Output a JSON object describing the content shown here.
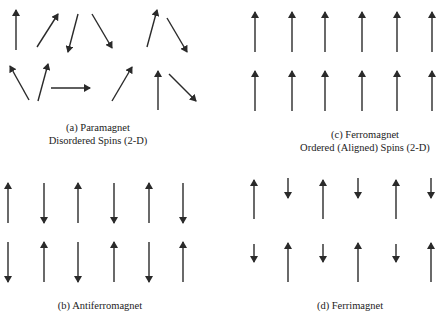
{
  "panels": [
    {
      "id": "a",
      "caption_line1": "(a) Paramagnet",
      "caption_line2": "Disordered Spins (2-D)",
      "arrows": [
        [
          16,
          50,
          16,
          10
        ],
        [
          37,
          47,
          58,
          14
        ],
        [
          78,
          14,
          68,
          52
        ],
        [
          92,
          14,
          112,
          48
        ],
        [
          147,
          47,
          157,
          10
        ],
        [
          167,
          18,
          187,
          52
        ],
        [
          29,
          100,
          10,
          66
        ],
        [
          38,
          101,
          48,
          64
        ],
        [
          51,
          88,
          90,
          88
        ],
        [
          112,
          101,
          132,
          67
        ],
        [
          158,
          110,
          158,
          71
        ],
        [
          169,
          74,
          196,
          101
        ]
      ]
    },
    {
      "id": "c",
      "caption_line1": "(c) Ferromagnet",
      "caption_line2": "Ordered (Aligned) Spins (2-D)",
      "arrows": [
        [
          255,
          52,
          255,
          12
        ],
        [
          292,
          52,
          292,
          12
        ],
        [
          325,
          52,
          325,
          12
        ],
        [
          362,
          52,
          362,
          12
        ],
        [
          397,
          52,
          397,
          12
        ],
        [
          432,
          52,
          432,
          12
        ],
        [
          255,
          111,
          255,
          71
        ],
        [
          292,
          111,
          292,
          71
        ],
        [
          325,
          111,
          325,
          71
        ],
        [
          362,
          111,
          362,
          71
        ],
        [
          397,
          111,
          397,
          71
        ],
        [
          432,
          111,
          432,
          71
        ]
      ]
    },
    {
      "id": "b",
      "caption_line1": "(b) Antiferromagnet",
      "caption_line2": "",
      "arrows": [
        [
          8,
          223,
          8,
          183
        ],
        [
          44,
          183,
          44,
          223
        ],
        [
          78,
          223,
          78,
          183
        ],
        [
          114,
          183,
          114,
          223
        ],
        [
          149,
          223,
          149,
          183
        ],
        [
          183,
          183,
          183,
          223
        ],
        [
          8,
          242,
          8,
          282
        ],
        [
          44,
          282,
          44,
          242
        ],
        [
          78,
          242,
          78,
          282
        ],
        [
          114,
          282,
          114,
          242
        ],
        [
          149,
          242,
          149,
          282
        ],
        [
          183,
          282,
          183,
          242
        ]
      ]
    },
    {
      "id": "d",
      "caption_line1": "(d) Ferrimagnet",
      "caption_line2": "",
      "arrows": [
        [
          254,
          219,
          254,
          180
        ],
        [
          288,
          178,
          288,
          198
        ],
        [
          323,
          219,
          323,
          180
        ],
        [
          358,
          178,
          358,
          198
        ],
        [
          396,
          219,
          396,
          180
        ],
        [
          431,
          178,
          431,
          198
        ],
        [
          254,
          244,
          254,
          262
        ],
        [
          288,
          282,
          288,
          243
        ],
        [
          323,
          244,
          323,
          262
        ],
        [
          358,
          282,
          358,
          243
        ],
        [
          396,
          244,
          396,
          262
        ],
        [
          431,
          282,
          431,
          243
        ]
      ]
    }
  ],
  "colors": {
    "arrow": "#2a2a2a",
    "text": "#222222"
  }
}
